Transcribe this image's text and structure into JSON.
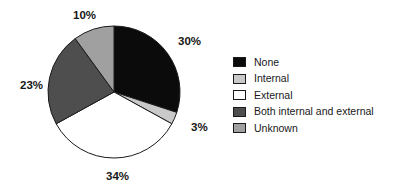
{
  "chart_data": {
    "type": "pie",
    "title": "",
    "xlabel": "",
    "ylabel": "",
    "legend_position": "right",
    "grid": false,
    "start_angle_deg": 0,
    "direction": "clockwise",
    "categories": [
      "None",
      "Internal",
      "External",
      "Both internal and external",
      "Unknown"
    ],
    "values": [
      30,
      3,
      34,
      23,
      10
    ],
    "value_unit": "%",
    "data_labels": [
      "30%",
      "3%",
      "34%",
      "23%",
      "10%"
    ],
    "colors": [
      "#0b0b0b",
      "#c9c9c9",
      "#ffffff",
      "#4e4e4e",
      "#a0a0a0"
    ],
    "slices": [
      {
        "label": "None",
        "value": 30,
        "data_label": "30%",
        "color": "#0b0b0b",
        "start_deg": 0,
        "end_deg": 108,
        "label_x": 178,
        "label_y": 45
      },
      {
        "label": "Internal",
        "value": 3,
        "data_label": "3%",
        "color": "#c9c9c9",
        "start_deg": 108,
        "end_deg": 118.8,
        "label_x": 191,
        "label_y": 131
      },
      {
        "label": "External",
        "value": 34,
        "data_label": "34%",
        "color": "#ffffff",
        "start_deg": 118.8,
        "end_deg": 241.2,
        "label_x": 106,
        "label_y": 180
      },
      {
        "label": "Both internal and external",
        "value": 23,
        "data_label": "23%",
        "color": "#4e4e4e",
        "start_deg": 241.2,
        "end_deg": 324,
        "label_x": 20,
        "label_y": 89
      },
      {
        "label": "Unknown",
        "value": 10,
        "data_label": "10%",
        "color": "#a0a0a0",
        "start_deg": 324,
        "end_deg": 360,
        "label_x": 73,
        "label_y": 19
      }
    ],
    "geometry": {
      "center_x": 114,
      "center_y": 92,
      "radius": 66,
      "outline_color": "#1a1a1a"
    }
  },
  "legend": {
    "items": [
      {
        "label": "None",
        "color": "#0b0b0b"
      },
      {
        "label": "Internal",
        "color": "#c9c9c9"
      },
      {
        "label": "External",
        "color": "#ffffff"
      },
      {
        "label": "Both internal and external",
        "color": "#4e4e4e"
      },
      {
        "label": "Unknown",
        "color": "#a0a0a0"
      }
    ]
  }
}
